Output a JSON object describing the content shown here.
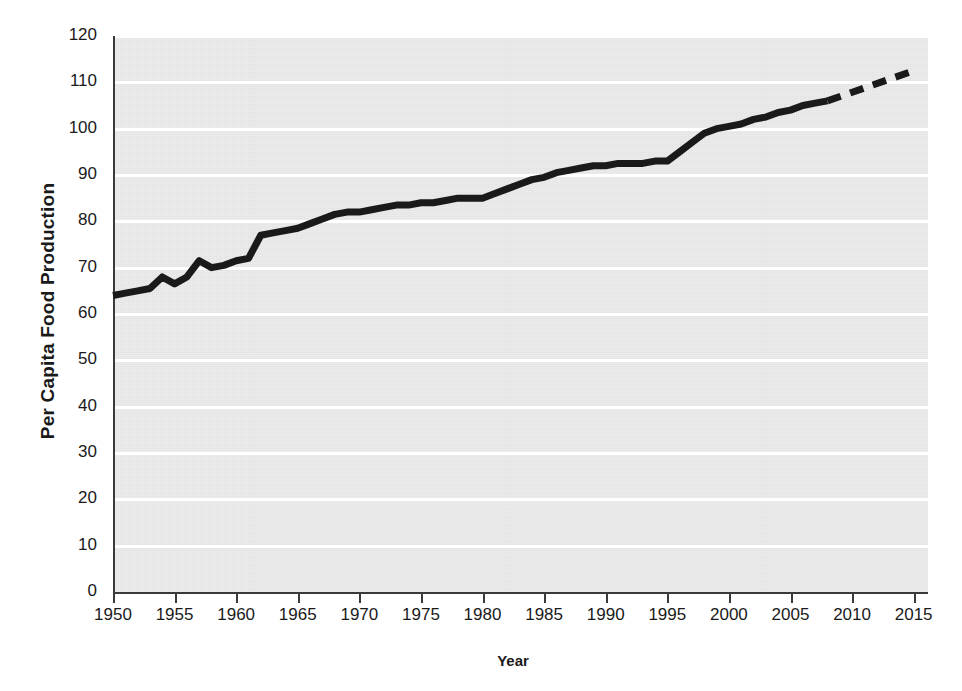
{
  "chart_data": {
    "type": "line",
    "title": "",
    "xlabel": "Year",
    "ylabel": "Per Capita Food Production",
    "xlim": [
      1950,
      2016
    ],
    "ylim": [
      0,
      120
    ],
    "grid": "horizontal",
    "legend": "none",
    "x_ticks": [
      "1950",
      "1955",
      "1960",
      "1965",
      "1970",
      "1975",
      "1980",
      "1985",
      "1990",
      "1995",
      "2000",
      "2005",
      "2010",
      "2015"
    ],
    "y_ticks": [
      "0",
      "10",
      "20",
      "30",
      "40",
      "50",
      "60",
      "70",
      "80",
      "90",
      "100",
      "110",
      "120"
    ],
    "series": [
      {
        "name": "Per Capita Food Production",
        "style": "solid",
        "color": "#1a1a1a",
        "x": [
          1950,
          1951,
          1952,
          1953,
          1954,
          1955,
          1956,
          1957,
          1958,
          1959,
          1960,
          1961,
          1962,
          1963,
          1964,
          1965,
          1966,
          1967,
          1968,
          1969,
          1970,
          1971,
          1972,
          1973,
          1974,
          1975,
          1976,
          1977,
          1978,
          1979,
          1980,
          1981,
          1982,
          1983,
          1984,
          1985,
          1986,
          1987,
          1988,
          1989,
          1990,
          1991,
          1992,
          1993,
          1994,
          1995,
          1996,
          1997,
          1998,
          1999,
          2000,
          2001,
          2002,
          2003,
          2004,
          2005,
          2006,
          2007,
          2008
        ],
        "values": [
          64,
          64.5,
          65,
          65.5,
          68,
          66.5,
          68,
          71.5,
          70,
          70.5,
          71.5,
          72,
          77,
          77.5,
          78,
          78.5,
          79.5,
          80.5,
          81.5,
          82,
          82,
          82.5,
          83,
          83.5,
          83.5,
          84,
          84,
          84.5,
          85,
          85,
          85,
          86,
          87,
          88,
          89,
          89.5,
          90.5,
          91,
          91.5,
          92,
          92,
          92.5,
          92.5,
          92.5,
          93,
          93,
          95,
          97,
          99,
          100,
          100.5,
          101,
          102,
          102.5,
          103.5,
          104,
          105,
          105.5,
          106
        ]
      },
      {
        "name": "Projection",
        "style": "dashed",
        "color": "#1a1a1a",
        "x": [
          2008,
          2015
        ],
        "values": [
          106,
          112.5
        ]
      }
    ]
  },
  "axes": {
    "y_title": "Per Capita Food Production",
    "x_title": "Year"
  }
}
